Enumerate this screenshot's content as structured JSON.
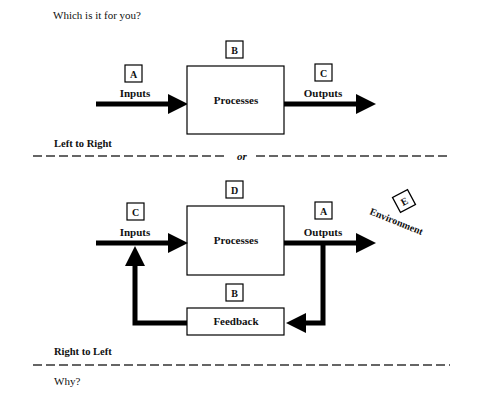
{
  "question": "Which is it for you?",
  "footer_question": "Why?",
  "separator_word": "or",
  "diagram_top": {
    "caption": "Left to Right",
    "input_label": "Inputs",
    "input_tag": "A",
    "process_label": "Processes",
    "process_tag": "B",
    "output_label": "Outputs",
    "output_tag": "C"
  },
  "diagram_bottom": {
    "caption": "Right to Left",
    "input_label": "Inputs",
    "input_tag": "C",
    "process_label": "Processes",
    "process_tag": "D",
    "output_label": "Outputs",
    "output_tag": "A",
    "feedback_label": "Feedback",
    "feedback_tag": "B",
    "environment_label": "Environment",
    "environment_tag": "E"
  }
}
